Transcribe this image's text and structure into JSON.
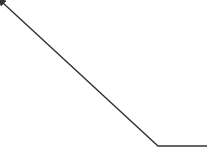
{
  "diagram": {
    "connector": {
      "type": "polyline-arrow",
      "color": "#333333",
      "stroke_width": 1.4,
      "points": [
        [
          3,
          3
        ],
        [
          158,
          146
        ],
        [
          207,
          146
        ]
      ],
      "arrowhead": "start"
    }
  }
}
